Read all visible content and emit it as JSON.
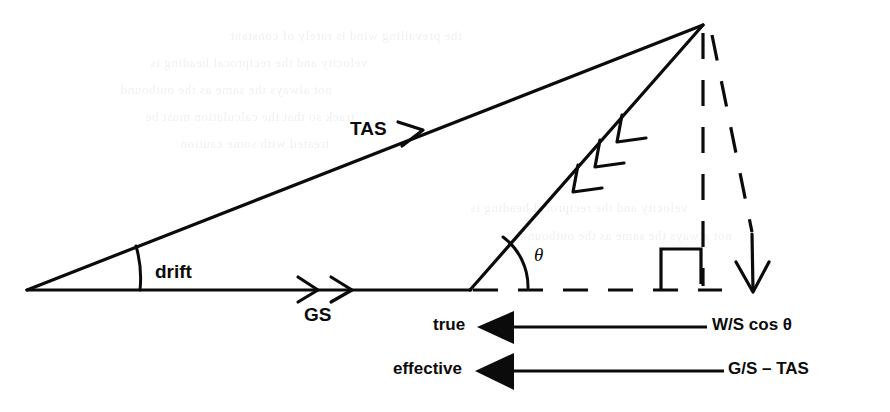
{
  "figure": {
    "background_color": "#ffffff",
    "ink_color": "#0b0b0b"
  },
  "labels": {
    "tas": "TAS",
    "drift": "drift",
    "gs": "GS",
    "theta": "θ",
    "true": "true",
    "effective": "effective",
    "ws_cos_theta": "W/S cos θ",
    "gs_minus_tas": "G/S – TAS"
  },
  "vectors": [
    {
      "name": "true-airspeed-vector",
      "label": "TAS",
      "from": [
        27,
        290
      ],
      "to": [
        703,
        25
      ],
      "arrowheads": 1,
      "arrow_style": "chevron",
      "line_style": "solid"
    },
    {
      "name": "ground-speed-vector",
      "label": "GS",
      "from": [
        27,
        290
      ],
      "to": [
        470,
        290
      ],
      "arrowheads": 2,
      "arrow_style": "chevron",
      "line_style": "solid"
    },
    {
      "name": "wind-speed-vector",
      "label": "",
      "from": [
        703,
        25
      ],
      "to": [
        470,
        290
      ],
      "arrowheads": 3,
      "arrow_style": "chevron",
      "line_style": "solid"
    },
    {
      "name": "vertical-dashed-drop",
      "label": "",
      "from": [
        703,
        25
      ],
      "to": [
        703,
        290
      ],
      "arrowheads": 0,
      "arrow_style": "none",
      "line_style": "dashed"
    },
    {
      "name": "slanted-dashed-drop",
      "label": "",
      "from": [
        703,
        25
      ],
      "to": [
        753,
        270
      ],
      "arrowheads": 0,
      "arrow_style": "none",
      "line_style": "dashed"
    },
    {
      "name": "vertical-component-arrow",
      "label": "",
      "from": [
        753,
        233
      ],
      "to": [
        753,
        292
      ],
      "arrowheads": 1,
      "arrow_style": "open",
      "line_style": "solid"
    },
    {
      "name": "true-headwind-arrow",
      "label": "W/S cos θ",
      "from": [
        703,
        327
      ],
      "to": [
        481,
        327
      ],
      "arrowheads": 1,
      "arrow_style": "filled-triangle",
      "line_style": "solid"
    },
    {
      "name": "effective-headwind-arrow",
      "label": "G/S – TAS",
      "from": [
        720,
        371
      ],
      "to": [
        481,
        371
      ],
      "arrowheads": 1,
      "arrow_style": "filled-triangle",
      "line_style": "solid"
    }
  ],
  "angles": [
    {
      "name": "drift-angle",
      "label": "drift",
      "vertex": [
        27,
        290
      ],
      "marker": "arc"
    },
    {
      "name": "theta-angle",
      "label": "θ",
      "vertex": [
        470,
        290
      ],
      "marker": "arc"
    },
    {
      "name": "right-angle",
      "label": "",
      "vertex": [
        703,
        290
      ],
      "marker": "square"
    }
  ],
  "dashed_baseline": {
    "name": "dashed-baseline",
    "from": [
      470,
      290
    ],
    "to": [
      720,
      290
    ]
  },
  "ghost_text": [
    "the prevailing wind is rarely of constant",
    "velocity and the reciprocal heading is",
    "not always the same as the outbound",
    "track so that the calculation must be",
    "treated with some caution"
  ]
}
